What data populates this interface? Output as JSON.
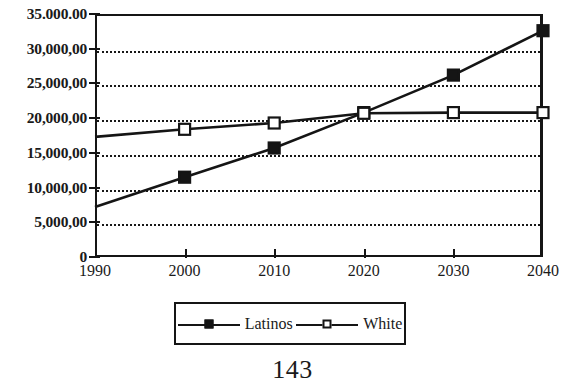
{
  "page": {
    "page_number": "143"
  },
  "chart_data": {
    "type": "line",
    "title": "",
    "subtitle": "",
    "xlabel": "",
    "ylabel": "",
    "x": [
      1990,
      2000,
      2010,
      2020,
      2030,
      2040
    ],
    "categories": [
      "1990",
      "2000",
      "2010",
      "2020",
      "2030",
      "2040"
    ],
    "series": [
      {
        "name": "Latinos",
        "marker": "filled-square",
        "color": "#151515",
        "values": [
          7200,
          11500,
          15700,
          20800,
          26200,
          32600
        ]
      },
      {
        "name": "White",
        "marker": "hollow-square",
        "color": "#151515",
        "values": [
          17300,
          18400,
          19300,
          20700,
          20800,
          20800
        ]
      }
    ],
    "xlim": [
      1990,
      2040
    ],
    "ylim": [
      0,
      35000
    ],
    "ytick_values": [
      0,
      5000,
      10000,
      15000,
      20000,
      25000,
      30000,
      35000
    ],
    "ytick_labels": [
      "0",
      "5,000,00",
      "10,000,00",
      "15,000,00",
      "20,000,00",
      "25,000,00",
      "30,000,00",
      "35.000.00"
    ],
    "xtick_labels": [
      "1990",
      "2000",
      "2010",
      "2020",
      "2030",
      "2040"
    ],
    "grid": "horizontal-dotted",
    "legend_position": "bottom-center",
    "legend_entries": [
      "Latinos",
      "White"
    ]
  }
}
